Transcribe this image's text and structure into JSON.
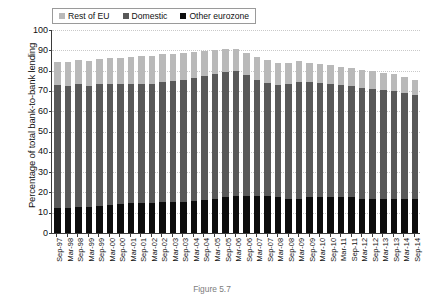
{
  "chart_data": {
    "type": "bar",
    "stacked": true,
    "title": "",
    "xlabel": "",
    "ylabel": "Percentage of total bank-to-bank lending",
    "ylim": [
      0,
      100
    ],
    "yticks": [
      0,
      10,
      20,
      30,
      40,
      50,
      60,
      70,
      80,
      90,
      100
    ],
    "grid": true,
    "legend_position": "top-left",
    "legend": [
      "Rest of EU",
      "Domestic",
      "Other eurozone"
    ],
    "categories": [
      "Sep-97",
      "Mar-98",
      "Sep-98",
      "Mar-99",
      "Sep-99",
      "Mar-00",
      "Sep-00",
      "Mar-01",
      "Sep-01",
      "Mar-02",
      "Sep-02",
      "Mar-03",
      "Sep-03",
      "Mar-04",
      "Sep-04",
      "Mar-05",
      "Sep-05",
      "Mar-06",
      "Sep-06",
      "Mar-07",
      "Sep-07",
      "Mar-08",
      "Sep-08",
      "Mar-09",
      "Sep-09",
      "Mar-10",
      "Sep-10",
      "Mar-11",
      "Sep-11",
      "Mar-12",
      "Sep-12",
      "Mar-13",
      "Sep-13",
      "Mar-14",
      "Sep-14"
    ],
    "series": [
      {
        "name": "Other eurozone",
        "color": "#0d0d0d",
        "stack_order": 0,
        "values": [
          12.5,
          12.5,
          13.0,
          13.0,
          13.5,
          14.0,
          14.5,
          15.0,
          15.0,
          15.0,
          15.5,
          15.5,
          15.5,
          16.0,
          16.5,
          17.0,
          17.5,
          18.0,
          18.0,
          18.0,
          18.0,
          17.5,
          17.0,
          17.0,
          17.5,
          17.5,
          17.5,
          17.5,
          17.5,
          17.0,
          17.0,
          17.0,
          17.0,
          17.0,
          17.0
        ]
      },
      {
        "name": "Domestic",
        "color": "#595959",
        "stack_order": 1,
        "values": [
          60.5,
          60.0,
          60.5,
          59.5,
          60.0,
          59.5,
          59.0,
          58.5,
          58.5,
          58.5,
          59.0,
          59.5,
          60.0,
          60.5,
          61.0,
          61.5,
          62.0,
          62.0,
          60.0,
          57.5,
          56.0,
          55.5,
          56.5,
          57.5,
          57.0,
          56.5,
          56.0,
          55.5,
          55.0,
          54.5,
          54.0,
          53.5,
          53.0,
          52.0,
          51.0
        ]
      },
      {
        "name": "Rest of EU",
        "color": "#b9b9b9",
        "stack_order": 2,
        "values": [
          11.0,
          11.5,
          11.5,
          12.0,
          12.0,
          12.5,
          12.5,
          13.0,
          13.5,
          13.5,
          13.5,
          13.0,
          13.0,
          12.5,
          12.0,
          11.5,
          11.0,
          10.5,
          10.5,
          11.0,
          11.0,
          11.0,
          10.5,
          10.0,
          9.5,
          9.5,
          9.5,
          9.0,
          9.0,
          9.0,
          9.0,
          8.5,
          8.5,
          8.0,
          7.5
        ]
      }
    ],
    "stack_totals": [
      84.0,
      84.0,
      85.0,
      84.5,
      85.5,
      86.0,
      86.0,
      86.5,
      87.0,
      87.0,
      88.0,
      88.0,
      88.5,
      89.0,
      89.5,
      90.0,
      90.5,
      90.5,
      88.5,
      86.5,
      85.0,
      84.0,
      84.0,
      84.5,
      84.0,
      83.5,
      83.0,
      82.0,
      81.5,
      80.5,
      80.0,
      79.0,
      78.5,
      77.0,
      75.5
    ]
  },
  "caption": {
    "text": "Figure 5.7"
  }
}
